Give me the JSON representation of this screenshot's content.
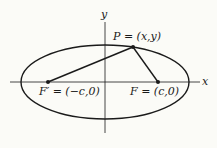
{
  "diagram": {
    "type": "ellipse-foci",
    "axes": {
      "x_label": "x",
      "y_label": "y"
    },
    "points": {
      "P": {
        "label": "P = (x,y)",
        "name": "P",
        "coords": "(x,y)"
      },
      "F_prime": {
        "label": "F′ = (−c,0)",
        "name": "F′",
        "coords": "(−c,0)"
      },
      "F": {
        "label": "F = (c,0)",
        "name": "F",
        "coords": "(c,0)"
      }
    },
    "segments": [
      "F′P",
      "PF"
    ],
    "colors": {
      "stroke": "#1a1a1a",
      "background": "#fbfbf7"
    }
  }
}
